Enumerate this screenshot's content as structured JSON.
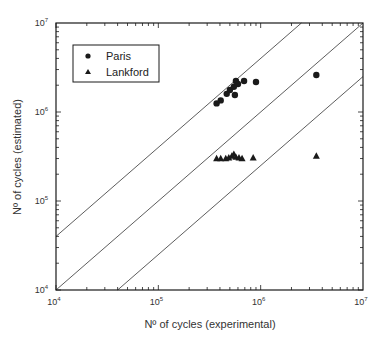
{
  "chart_data": {
    "type": "scatter",
    "title": "",
    "xlabel": "Nº of cycles (experimental)",
    "ylabel": "Nº of cycles (estimated)",
    "xscale": "log",
    "yscale": "log",
    "xlim": [
      10000,
      10000000
    ],
    "ylim": [
      10000,
      10000000
    ],
    "x_ticks": [
      {
        "base": "10",
        "exp": "4",
        "value": 10000
      },
      {
        "base": "10",
        "exp": "5",
        "value": 100000
      },
      {
        "base": "10",
        "exp": "6",
        "value": 1000000
      },
      {
        "base": "10",
        "exp": "7",
        "value": 10000000
      }
    ],
    "y_ticks": [
      {
        "base": "10",
        "exp": "4",
        "value": 10000
      },
      {
        "base": "10",
        "exp": "5",
        "value": 100000
      },
      {
        "base": "10",
        "exp": "6",
        "value": 1000000
      },
      {
        "base": "10",
        "exp": "7",
        "value": 10000000
      }
    ],
    "grid": false,
    "legend_position": "upper left",
    "reference_lines": [
      {
        "label": "factor 4 (upper)",
        "factor": 4
      },
      {
        "label": "y = x",
        "factor": 1
      },
      {
        "label": "factor 1/4 (lower)",
        "factor": 0.25
      }
    ],
    "series": [
      {
        "name": "Paris",
        "marker": "circle",
        "points": [
          [
            371000,
            1250000
          ],
          [
            407000,
            1350000
          ],
          [
            466000,
            1600000
          ],
          [
            500000,
            1770000
          ],
          [
            547000,
            1920000
          ],
          [
            573000,
            2230000
          ],
          [
            600000,
            2060000
          ],
          [
            560000,
            1550000
          ],
          [
            688000,
            2230000
          ],
          [
            900000,
            2170000
          ],
          [
            3500000,
            2600000
          ]
        ]
      },
      {
        "name": "Lankford",
        "marker": "triangle",
        "points": [
          [
            371000,
            300000
          ],
          [
            407000,
            300000
          ],
          [
            456000,
            300000
          ],
          [
            488000,
            305000
          ],
          [
            523000,
            320000
          ],
          [
            547000,
            335000
          ],
          [
            573000,
            310000
          ],
          [
            614000,
            305000
          ],
          [
            658000,
            300000
          ],
          [
            845000,
            305000
          ],
          [
            3500000,
            320000
          ]
        ]
      }
    ]
  },
  "legend": {
    "items": [
      {
        "label": "Paris",
        "marker": "circle"
      },
      {
        "label": "Lankford",
        "marker": "triangle"
      }
    ]
  },
  "colors": {
    "marker": "#1a1a1a",
    "axis": "#1a1a1a",
    "line": "#333333"
  }
}
